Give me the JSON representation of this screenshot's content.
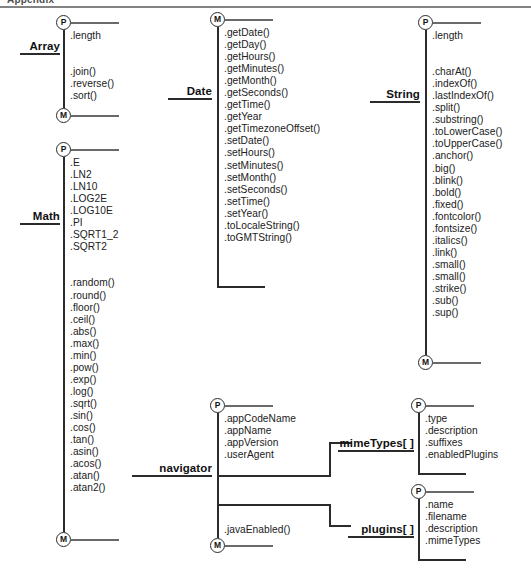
{
  "page": {
    "top_artifact_text": "Appendix",
    "background_color": "#ffffff",
    "line_color": "#2b2b2b"
  },
  "legend": {
    "property_node": "P",
    "method_node": "M"
  },
  "groups": [
    {
      "id": "array",
      "label": "Array",
      "top_node": "P",
      "bottom_node": "M",
      "properties": [
        ".length"
      ],
      "methods": [
        ".join()",
        ".reverse()",
        ".sort()"
      ]
    },
    {
      "id": "math",
      "label": "Math",
      "top_node": "P",
      "bottom_node": "M",
      "properties": [
        ".E",
        ".LN2",
        ".LN10",
        ".LOG2E",
        ".LOG10E",
        ".PI",
        ".SQRT1_2",
        ".SQRT2"
      ],
      "methods": [
        ".random()",
        ".round()",
        ".floor()",
        ".ceil()",
        ".abs()",
        ".max()",
        ".min()",
        ".pow()",
        ".exp()",
        ".log()",
        ".sqrt()",
        ".sin()",
        ".cos()",
        ".tan()",
        ".asin()",
        ".acos()",
        ".atan()",
        ".atan2()"
      ]
    },
    {
      "id": "date",
      "label": "Date",
      "top_node": "M",
      "bottom_node": "",
      "properties": [],
      "methods": [
        ".getDate()",
        ".getDay()",
        ".getHours()",
        ".getMinutes()",
        ".getMonth()",
        ".getSeconds()",
        ".getTime()",
        ".getYear",
        ".getTimezoneOffset()",
        ".setDate()",
        ".setHours()",
        ".setMinutes()",
        ".setMonth()",
        ".setSeconds()",
        ".setTime()",
        ".setYear()",
        ".toLocaleString()",
        ".toGMTString()"
      ]
    },
    {
      "id": "string",
      "label": "String",
      "top_node": "P",
      "bottom_node": "M",
      "properties": [
        ".length"
      ],
      "methods": [
        ".charAt()",
        ".indexOf()",
        ".lastIndexOf()",
        ".split()",
        ".substring()",
        ".toLowerCase()",
        ".toUpperCase()",
        ".anchor()",
        ".big()",
        ".blink()",
        ".bold()",
        ".fixed()",
        ".fontcolor()",
        ".fontsize()",
        ".italics()",
        ".link()",
        ".small()",
        ".small()",
        ".strike()",
        ".sub()",
        ".sup()"
      ]
    },
    {
      "id": "navigator",
      "label": "navigator",
      "top_node": "P",
      "bottom_node": "M",
      "properties": [
        ".appCodeName",
        ".appName",
        ".appVersion",
        ".userAgent"
      ],
      "methods": [
        ".javaEnabled()"
      ]
    },
    {
      "id": "mimetypes",
      "label": "mimeTypes[ ]",
      "top_node": "P",
      "bottom_node": "",
      "properties": [
        ".type",
        ".description",
        ".suffixes",
        ".enabledPlugins"
      ],
      "methods": []
    },
    {
      "id": "plugins",
      "label": "plugins[ ]",
      "top_node": "P",
      "bottom_node": "",
      "properties": [
        ".name",
        ".filename",
        ".description",
        ".mimeTypes"
      ],
      "methods": []
    }
  ]
}
